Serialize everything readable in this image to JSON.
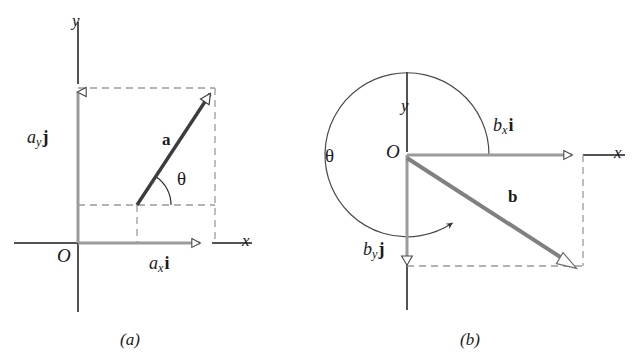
{
  "figure": {
    "kind": "vector-component-diagram",
    "background_color": "#ffffff",
    "ink_color": "#1a1a1a",
    "vector_color": "#808080",
    "component_color": "#999999",
    "dashed_color": "#9a9a9a"
  },
  "panel_a": {
    "caption": "(a)",
    "origin_label": "O",
    "x_axis_label": "x",
    "y_axis_label": "y",
    "angle_label": "θ",
    "vector_label": "a",
    "x_component": {
      "var": "a",
      "sub": "x",
      "unit": "i"
    },
    "y_component": {
      "var": "a",
      "sub": "y",
      "unit": "j"
    },
    "geometry": {
      "origin": [
        78,
        243
      ],
      "vector_tail": [
        137,
        205
      ],
      "vector_tip": [
        215,
        88
      ],
      "x_comp_start": [
        78,
        243
      ],
      "x_comp_end": [
        208,
        243
      ],
      "y_comp_start": [
        78,
        243
      ],
      "y_comp_end": [
        78,
        88
      ],
      "angle_degrees": 56,
      "angle_arc_radius": 34
    }
  },
  "panel_b": {
    "caption": "(b)",
    "origin_label": "O",
    "x_axis_label": "x",
    "y_axis_label": "y",
    "angle_label": "θ",
    "vector_label": "b",
    "x_component": {
      "var": "b",
      "sub": "x",
      "unit": "i"
    },
    "y_component": {
      "var": "b",
      "sub": "y",
      "unit": "j"
    },
    "geometry": {
      "origin": [
        407,
        155
      ],
      "vector_tail": [
        407,
        158
      ],
      "vector_tip": [
        573,
        266
      ],
      "x_comp_start": [
        407,
        155
      ],
      "x_comp_end": [
        578,
        155
      ],
      "y_comp_start": [
        407,
        155
      ],
      "y_comp_end": [
        407,
        263
      ],
      "angle_degrees": 327,
      "angle_arc_radius": 82
    }
  }
}
